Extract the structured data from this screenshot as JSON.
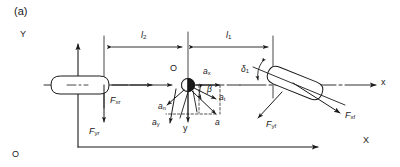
{
  "figure": {
    "caption": "(a)",
    "colors": {
      "line": "#1a1a1a",
      "text": "#1a1a1a",
      "background": "#ffffff",
      "cg_fill": "#1a1a1a"
    }
  },
  "axes": {
    "global_y_label": "Y",
    "global_x_label": "X",
    "origin_label": "O",
    "body_x_label": "x",
    "body_y_label": "y"
  },
  "dimensions": [
    {
      "id": "l2",
      "label": "l",
      "subscript": "2",
      "meaning": "distance from CG to rear axle"
    },
    {
      "id": "l1",
      "label": "l",
      "subscript": "1",
      "meaning": "distance from CG to front axle"
    }
  ],
  "cg": {
    "label": "O",
    "marker": "half-filled-circle"
  },
  "angles": [
    {
      "id": "delta1",
      "label": "δ",
      "subscript": "1",
      "meaning": "front wheel steer angle"
    },
    {
      "id": "beta",
      "label": "β",
      "subscript": "",
      "meaning": "sideslip angle of acceleration vector"
    }
  ],
  "accelerations": [
    {
      "id": "ax",
      "label": "a",
      "subscript": "x",
      "meaning": "longitudinal acceleration"
    },
    {
      "id": "ay",
      "label": "a",
      "subscript": "y",
      "meaning": "lateral acceleration"
    },
    {
      "id": "an",
      "label": "a",
      "subscript": "n",
      "meaning": "normal (centripetal) acceleration"
    },
    {
      "id": "at",
      "label": "a",
      "subscript": "t",
      "meaning": "tangential acceleration"
    },
    {
      "id": "a",
      "label": "a",
      "subscript": "",
      "meaning": "resultant acceleration"
    }
  ],
  "forces": [
    {
      "id": "Fxr",
      "label": "F",
      "subscript": "xr",
      "meaning": "rear longitudinal force"
    },
    {
      "id": "Fyr",
      "label": "F",
      "subscript": "yr",
      "meaning": "rear lateral force"
    },
    {
      "id": "Fxf",
      "label": "F",
      "subscript": "xf",
      "meaning": "front longitudinal force"
    },
    {
      "id": "Fyf",
      "label": "F",
      "subscript": "yf",
      "meaning": "front lateral force"
    }
  ],
  "wheels": [
    {
      "id": "rear-wheel",
      "orientation": "aligned-with-body-x"
    },
    {
      "id": "front-wheel",
      "orientation": "steered"
    }
  ]
}
